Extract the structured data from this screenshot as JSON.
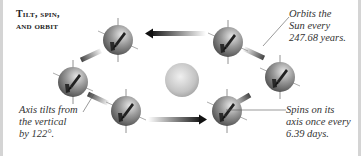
{
  "title": {
    "line1": "Tilt, spin,",
    "line2": "and orbit"
  },
  "captions": {
    "orbit": {
      "lines": [
        "Orbits the",
        "Sun every",
        "247.68 years."
      ]
    },
    "tilt": {
      "lines": [
        "Axis tilts from",
        "the vertical",
        "by 122°."
      ]
    },
    "spin": {
      "lines": [
        "Spins on its",
        "axis once every",
        "6.39 days."
      ]
    }
  },
  "facts": {
    "orbital_period_years": 247.68,
    "axial_tilt_degrees": 122,
    "rotation_period_days": 6.39
  },
  "elements": {
    "sun": {
      "label": "sun"
    },
    "planets": [
      {
        "id": "p1",
        "position": "top-left"
      },
      {
        "id": "p2",
        "position": "left"
      },
      {
        "id": "p3",
        "position": "bottom-left"
      },
      {
        "id": "p4",
        "position": "top-right"
      },
      {
        "id": "p5",
        "position": "right"
      },
      {
        "id": "p6",
        "position": "bottom-right"
      }
    ]
  },
  "colors": {
    "planet_light": "#c9c9c9",
    "planet_dark": "#555555",
    "sun_light": "#e8e8e8",
    "sun_dark": "#a8a8a8",
    "arrow": "#111111",
    "border": "#d4d4d4"
  }
}
